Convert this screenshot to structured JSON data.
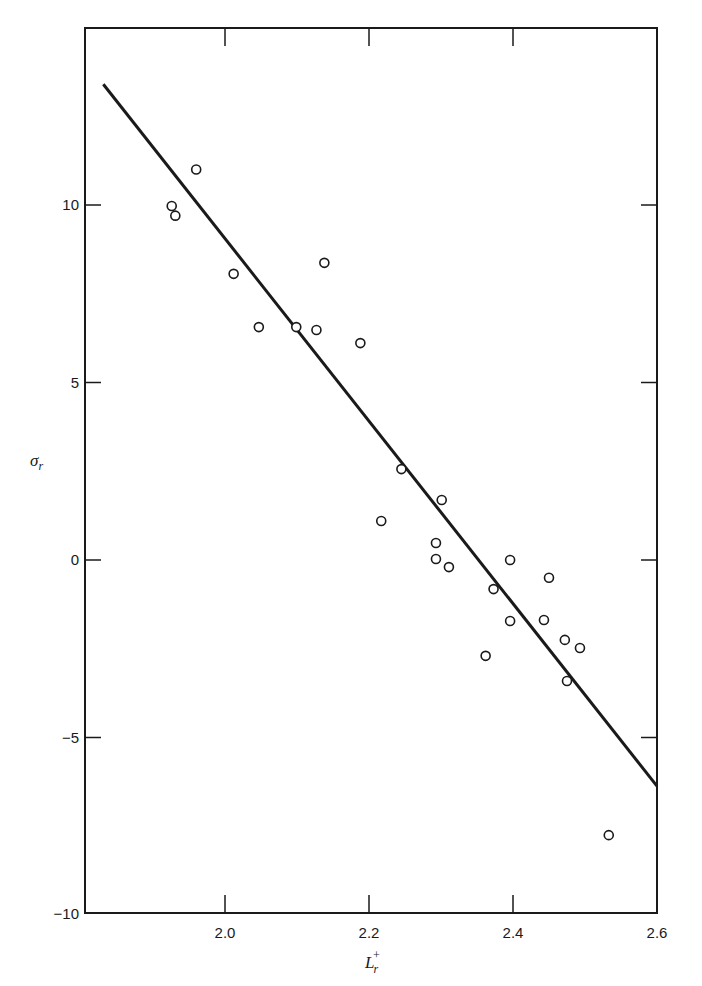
{
  "chart_data": {
    "type": "scatter",
    "title": "",
    "xlabel": "L_r^+",
    "ylabel": "σ_r",
    "xlabel_main": "L",
    "xlabel_sup": "+",
    "xlabel_sub": "r",
    "ylabel_main": "σ",
    "ylabel_sub": "r",
    "xlim": [
      1.806,
      2.6
    ],
    "ylim": [
      -10,
      13.8
    ],
    "grid": false,
    "legend": null,
    "x_ticks": [
      2.0,
      2.2,
      2.4,
      2.6
    ],
    "x_tick_labels": [
      "2.0",
      "2.2",
      "2.4",
      "2.6"
    ],
    "y_ticks": [
      -10,
      -5,
      0,
      5,
      10
    ],
    "y_tick_labels": [
      "−10",
      "−5",
      "0",
      "5",
      "10"
    ],
    "series": [
      {
        "name": "observations",
        "marker": "open-circle",
        "points": [
          {
            "x": 1.926,
            "y": 9.97
          },
          {
            "x": 1.931,
            "y": 9.7
          },
          {
            "x": 1.96,
            "y": 11.0
          },
          {
            "x": 2.012,
            "y": 8.06
          },
          {
            "x": 2.047,
            "y": 6.56
          },
          {
            "x": 2.099,
            "y": 6.56
          },
          {
            "x": 2.127,
            "y": 6.48
          },
          {
            "x": 2.138,
            "y": 8.37
          },
          {
            "x": 2.188,
            "y": 6.11
          },
          {
            "x": 2.217,
            "y": 1.1
          },
          {
            "x": 2.245,
            "y": 2.56
          },
          {
            "x": 2.293,
            "y": 0.48
          },
          {
            "x": 2.293,
            "y": 0.03
          },
          {
            "x": 2.301,
            "y": 1.69
          },
          {
            "x": 2.311,
            "y": -0.2
          },
          {
            "x": 2.362,
            "y": -2.7
          },
          {
            "x": 2.373,
            "y": -0.82
          },
          {
            "x": 2.396,
            "y": 0.0
          },
          {
            "x": 2.396,
            "y": -1.72
          },
          {
            "x": 2.443,
            "y": -1.69
          },
          {
            "x": 2.45,
            "y": -0.5
          },
          {
            "x": 2.472,
            "y": -2.25
          },
          {
            "x": 2.475,
            "y": -3.41
          },
          {
            "x": 2.493,
            "y": -2.48
          },
          {
            "x": 2.533,
            "y": -7.75
          }
        ]
      },
      {
        "name": "fitted line",
        "type": "line",
        "points": [
          {
            "x": 1.831,
            "y": 13.4
          },
          {
            "x": 2.6,
            "y": -6.37
          }
        ]
      }
    ]
  }
}
